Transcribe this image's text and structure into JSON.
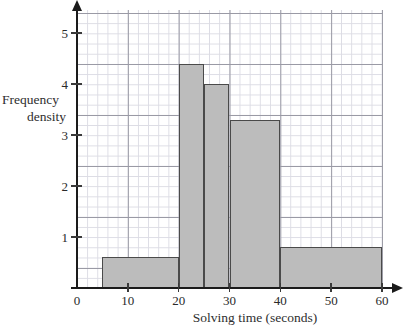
{
  "chart_data": {
    "type": "bar",
    "title": "",
    "subtitle": "",
    "xlabel": "Solving time (seconds)",
    "ylabel_line1": "Frequency",
    "ylabel_line2": "density",
    "ylabel": "Frequency density",
    "xlim": [
      0,
      60
    ],
    "ylim": [
      0,
      5.4
    ],
    "xticks": [
      0,
      10,
      20,
      30,
      40,
      50,
      60
    ],
    "xtick_labels": [
      "0",
      "10",
      "20",
      "30",
      "40",
      "50",
      "60"
    ],
    "yticks": [
      1,
      2,
      3,
      4,
      5
    ],
    "ytick_labels": [
      "1",
      "2",
      "3",
      "4",
      "5"
    ],
    "grid": "major and minor gridlines, 5 minor divisions per major",
    "legend": "none",
    "bin_edges": [
      5,
      20,
      25,
      30,
      40,
      60
    ],
    "bins": [
      {
        "x0": 5,
        "x1": 20,
        "value": 0.6,
        "label": "5-20"
      },
      {
        "x0": 20,
        "x1": 25,
        "value": 4.4,
        "label": "20-25"
      },
      {
        "x0": 25,
        "x1": 30,
        "value": 4.0,
        "label": "25-30"
      },
      {
        "x0": 30,
        "x1": 40,
        "value": 3.3,
        "label": "30-40"
      },
      {
        "x0": 40,
        "x1": 60,
        "value": 0.8,
        "label": "40-60"
      }
    ],
    "values": [
      0.6,
      4.4,
      4.0,
      3.3,
      0.8
    ],
    "categories": [
      "5-20",
      "20-25",
      "25-30",
      "30-40",
      "40-60"
    ],
    "colors": {
      "bar_fill": "#bcbcbc",
      "bar_stroke": "#4a4a4a",
      "axis": "#1b1b1b",
      "major_grid": "#9a9aa5",
      "minor_grid": "#dcdce4",
      "background": "#ffffff",
      "text": "#2e2e2e"
    }
  }
}
